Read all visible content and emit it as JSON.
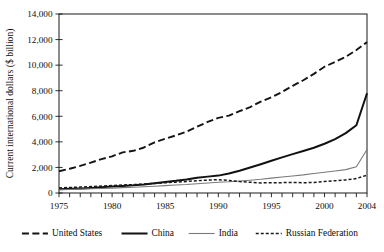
{
  "chart_data": {
    "type": "line",
    "title": "",
    "xlabel": "",
    "ylabel": "Current international dollars ($ billion)",
    "xlim": [
      1975,
      2004
    ],
    "ylim": [
      0,
      14000
    ],
    "grid": false,
    "legend_position": "bottom",
    "x": [
      1975,
      1976,
      1977,
      1978,
      1979,
      1980,
      1981,
      1982,
      1983,
      1984,
      1985,
      1986,
      1987,
      1988,
      1989,
      1990,
      1991,
      1992,
      1993,
      1994,
      1995,
      1996,
      1997,
      1998,
      1999,
      2000,
      2001,
      2002,
      2003,
      2004
    ],
    "xtick_labels": [
      "1975",
      "1980",
      "1985",
      "1990",
      "1995",
      "2000",
      "2004"
    ],
    "xtick_values": [
      1975,
      1980,
      1985,
      1990,
      1995,
      2000,
      2004
    ],
    "ytick_labels": [
      "0",
      "2,000",
      "4,000",
      "6,000",
      "8,000",
      "10,000",
      "12,000",
      "14,000"
    ],
    "ytick_values": [
      0,
      2000,
      4000,
      6000,
      8000,
      10000,
      12000,
      14000
    ],
    "series": [
      {
        "name": "United States",
        "style": "long-dash",
        "color": "#141414",
        "width": 1.9,
        "dasharray": "7,3.4",
        "values": [
          1700,
          1900,
          2120,
          2380,
          2650,
          2870,
          3180,
          3300,
          3560,
          3960,
          4250,
          4500,
          4800,
          5180,
          5560,
          5880,
          6050,
          6400,
          6720,
          7150,
          7480,
          7900,
          8380,
          8820,
          9320,
          9880,
          10250,
          10650,
          11180,
          11800
        ]
      },
      {
        "name": "China",
        "style": "solid-thick",
        "color": "#111111",
        "width": 2.0,
        "dasharray": "none",
        "values": [
          300,
          330,
          360,
          400,
          450,
          500,
          550,
          600,
          670,
          760,
          860,
          950,
          1060,
          1190,
          1280,
          1360,
          1520,
          1740,
          1990,
          2250,
          2520,
          2790,
          3040,
          3280,
          3540,
          3850,
          4220,
          4680,
          5300,
          7800
        ]
      },
      {
        "name": "India",
        "style": "solid-thin",
        "color": "#7a7a7a",
        "width": 1.1,
        "dasharray": "none",
        "values": [
          250,
          275,
          300,
          330,
          355,
          380,
          420,
          450,
          490,
          530,
          580,
          620,
          660,
          720,
          780,
          840,
          880,
          940,
          1000,
          1070,
          1160,
          1250,
          1330,
          1420,
          1530,
          1620,
          1720,
          1830,
          2050,
          3400
        ]
      },
      {
        "name": "Russian Federation",
        "style": "fine-dash",
        "color": "#1a1a1a",
        "width": 1.5,
        "dasharray": "3,2",
        "values": [
          400,
          430,
          460,
          500,
          540,
          580,
          620,
          660,
          700,
          750,
          800,
          850,
          900,
          960,
          1010,
          1040,
          980,
          900,
          840,
          790,
          800,
          810,
          830,
          800,
          830,
          900,
          960,
          1020,
          1130,
          1400
        ]
      }
    ]
  },
  "axes": {
    "ylabel": "Current international dollars ($ billion)"
  },
  "legend": {
    "items": [
      {
        "label": "United States"
      },
      {
        "label": "China"
      },
      {
        "label": "India"
      },
      {
        "label": "Russian Federation"
      }
    ]
  }
}
